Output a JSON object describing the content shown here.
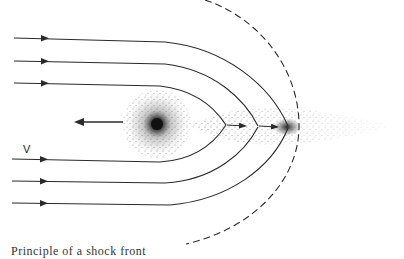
{
  "figure": {
    "labels": {
      "velocity": "V",
      "caption_fragment": "Principle of a shock front"
    },
    "colors": {
      "line": "#2a2a2a",
      "dots": "#333333",
      "background": "#ffffff"
    },
    "elements": {
      "streamlines_upper": 3,
      "streamlines_lower": 3,
      "shock_front": "dashed arc",
      "nucleus": "dense dot cloud",
      "motion_arrow": "leftward",
      "tail": "dot cloud extending right"
    }
  }
}
